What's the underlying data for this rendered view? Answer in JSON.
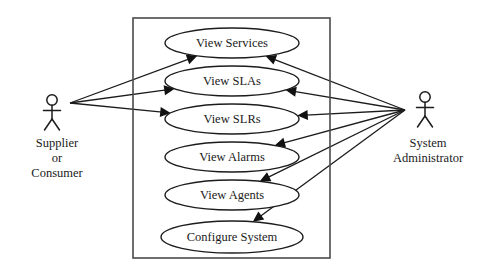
{
  "diagram": {
    "type": "uml-use-case-diagram",
    "system_boundary": {
      "x": 133,
      "y": 18,
      "width": 197,
      "height": 240,
      "label": ""
    },
    "use_cases": [
      {
        "id": "view-services",
        "label": "View Services",
        "cx": 232,
        "cy": 43,
        "rx": 67,
        "ry": 15
      },
      {
        "id": "view-slas",
        "label": "View SLAs",
        "cx": 232,
        "cy": 81,
        "rx": 67,
        "ry": 15
      },
      {
        "id": "view-slrs",
        "label": "View SLRs",
        "cx": 232,
        "cy": 119,
        "rx": 67,
        "ry": 15
      },
      {
        "id": "view-alarms",
        "label": "View Alarms",
        "cx": 232,
        "cy": 157,
        "rx": 67,
        "ry": 15
      },
      {
        "id": "view-agents",
        "label": "View Agents",
        "cx": 232,
        "cy": 195,
        "rx": 67,
        "ry": 15
      },
      {
        "id": "configure-system",
        "label": "Configure System",
        "cx": 232,
        "cy": 237,
        "rx": 71,
        "ry": 16
      }
    ],
    "actors": [
      {
        "id": "supplier-or-consumer",
        "lines": [
          "Supplier",
          "or",
          "Consumer"
        ],
        "head_cx": 52,
        "head_cy": 100,
        "label_x": 57,
        "label_y": 147,
        "origin_x": 70,
        "origin_y": 103
      },
      {
        "id": "system-administrator",
        "lines": [
          "System",
          "Administrator"
        ],
        "head_cx": 425,
        "head_cy": 97,
        "label_x": 428,
        "label_y": 147,
        "origin_x": 405,
        "origin_y": 110
      }
    ],
    "associations": [
      {
        "from": "supplier-or-consumer",
        "to": "view-services",
        "arrow_at": "target"
      },
      {
        "from": "supplier-or-consumer",
        "to": "view-slas",
        "arrow_at": "target"
      },
      {
        "from": "supplier-or-consumer",
        "to": "view-slrs",
        "arrow_at": "target"
      },
      {
        "from": "system-administrator",
        "to": "view-services",
        "arrow_at": "target"
      },
      {
        "from": "system-administrator",
        "to": "view-slas",
        "arrow_at": "target"
      },
      {
        "from": "system-administrator",
        "to": "view-slrs",
        "arrow_at": "target"
      },
      {
        "from": "system-administrator",
        "to": "view-alarms",
        "arrow_at": "target"
      },
      {
        "from": "system-administrator",
        "to": "view-agents",
        "arrow_at": "target"
      },
      {
        "from": "system-administrator",
        "to": "configure-system",
        "arrow_at": "target"
      }
    ],
    "colors": {
      "stroke": "#1c1c1c",
      "boundary": "#4a4a4a",
      "text": "#1a1a1a",
      "background": "#ffffff"
    }
  }
}
